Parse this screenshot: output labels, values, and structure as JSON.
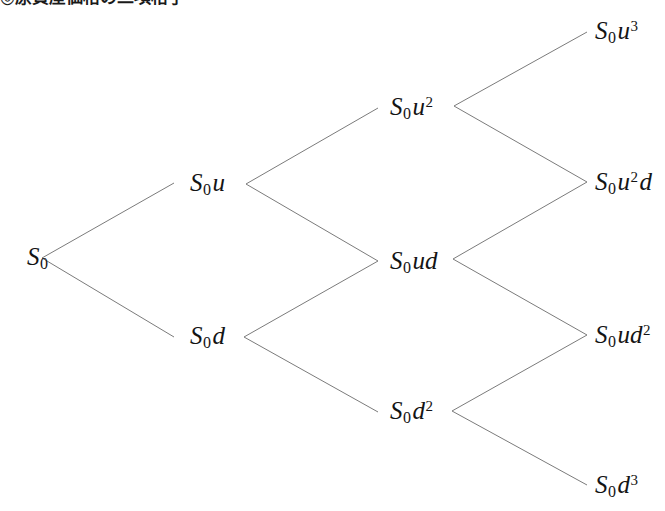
{
  "caption": {
    "text": "◎原資産価格の二項格子",
    "cropped": true
  },
  "diagram": {
    "type": "recombining-binomial-lattice",
    "periods": 3,
    "line_color": "#7b7b7b",
    "text_color": "#141414",
    "background_color": "#ffffff",
    "nodes": [
      {
        "id": "n0",
        "level": 0,
        "slot": 0,
        "x": 27,
        "y": 258,
        "label": "S0",
        "base": "S",
        "sub": "0",
        "factor": "",
        "exp": ""
      },
      {
        "id": "n1u",
        "level": 1,
        "slot": 0,
        "x": 190,
        "y": 184,
        "label": "S0u",
        "base": "S",
        "sub": "0",
        "factor": "u",
        "exp": ""
      },
      {
        "id": "n1d",
        "level": 1,
        "slot": 1,
        "x": 190,
        "y": 337,
        "label": "S0d",
        "base": "S",
        "sub": "0",
        "factor": "d",
        "exp": ""
      },
      {
        "id": "n2uu",
        "level": 2,
        "slot": 0,
        "x": 390,
        "y": 108,
        "label": "S0u2",
        "base": "S",
        "sub": "0",
        "factor": "u",
        "exp": "2"
      },
      {
        "id": "n2ud",
        "level": 2,
        "slot": 1,
        "x": 390,
        "y": 262,
        "label": "S0ud",
        "base": "S",
        "sub": "0",
        "factor": "ud",
        "exp": ""
      },
      {
        "id": "n2dd",
        "level": 2,
        "slot": 2,
        "x": 390,
        "y": 412,
        "label": "S0d2",
        "base": "S",
        "sub": "0",
        "factor": "d",
        "exp": "2"
      },
      {
        "id": "n3uuu",
        "level": 3,
        "slot": 0,
        "x": 595,
        "y": 32,
        "label": "S0u3",
        "base": "S",
        "sub": "0",
        "factor": "u",
        "exp": "3"
      },
      {
        "id": "n3uud",
        "level": 3,
        "slot": 1,
        "x": 595,
        "y": 183,
        "label": "S0u2d",
        "base": "S",
        "sub": "0",
        "factor": "u",
        "exp": "2",
        "tail": "d"
      },
      {
        "id": "n3udd",
        "level": 3,
        "slot": 2,
        "x": 595,
        "y": 336,
        "label": "S0ud2",
        "base": "S",
        "sub": "0",
        "factor": "ud",
        "exp": "2"
      },
      {
        "id": "n3ddd",
        "level": 3,
        "slot": 3,
        "x": 595,
        "y": 486,
        "label": "S0d3",
        "base": "S",
        "sub": "0",
        "factor": "d",
        "exp": "3"
      }
    ],
    "edges": [
      {
        "from": "n0",
        "to": "n1u",
        "move": "u",
        "x1": 42,
        "y1": 258,
        "x2": 174,
        "y2": 183
      },
      {
        "from": "n0",
        "to": "n1d",
        "move": "d",
        "x1": 42,
        "y1": 258,
        "x2": 174,
        "y2": 337
      },
      {
        "from": "n1u",
        "to": "n2uu",
        "move": "u",
        "x1": 246,
        "y1": 184,
        "x2": 378,
        "y2": 108
      },
      {
        "from": "n1u",
        "to": "n2ud",
        "move": "d",
        "x1": 246,
        "y1": 184,
        "x2": 378,
        "y2": 261
      },
      {
        "from": "n1d",
        "to": "n2ud",
        "move": "u",
        "x1": 244,
        "y1": 337,
        "x2": 378,
        "y2": 261
      },
      {
        "from": "n1d",
        "to": "n2dd",
        "move": "d",
        "x1": 244,
        "y1": 337,
        "x2": 378,
        "y2": 412
      },
      {
        "from": "n2uu",
        "to": "n3uuu",
        "move": "u",
        "x1": 454,
        "y1": 106,
        "x2": 587,
        "y2": 32
      },
      {
        "from": "n2uu",
        "to": "n3uud",
        "move": "d",
        "x1": 454,
        "y1": 106,
        "x2": 587,
        "y2": 182
      },
      {
        "from": "n2ud",
        "to": "n3uud",
        "move": "u",
        "x1": 453,
        "y1": 259,
        "x2": 587,
        "y2": 182
      },
      {
        "from": "n2ud",
        "to": "n3udd",
        "move": "d",
        "x1": 453,
        "y1": 259,
        "x2": 587,
        "y2": 335
      },
      {
        "from": "n2dd",
        "to": "n3udd",
        "move": "u",
        "x1": 452,
        "y1": 411,
        "x2": 587,
        "y2": 335
      },
      {
        "from": "n2dd",
        "to": "n3ddd",
        "move": "d",
        "x1": 452,
        "y1": 411,
        "x2": 587,
        "y2": 485
      }
    ]
  }
}
